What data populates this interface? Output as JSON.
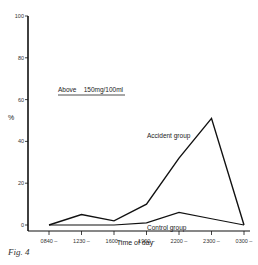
{
  "chart_data": {
    "type": "line",
    "title": "",
    "xlabel": "Time of day",
    "ylabel": "%",
    "ylim": [
      0,
      100
    ],
    "yticks": [
      0,
      20,
      40,
      60,
      80,
      100
    ],
    "categories": [
      "0840",
      "1230",
      "1600",
      "1900",
      "2200",
      "2300",
      "0300"
    ],
    "series": [
      {
        "name": "Accident group",
        "values": [
          0,
          5,
          2,
          10,
          32,
          51,
          0
        ]
      },
      {
        "name": "Control group",
        "values": [
          0,
          0,
          0,
          1,
          6,
          3,
          0
        ]
      }
    ],
    "annotation": "Above    150mg/100ml",
    "grid": false
  },
  "caption": "Fig. 4"
}
